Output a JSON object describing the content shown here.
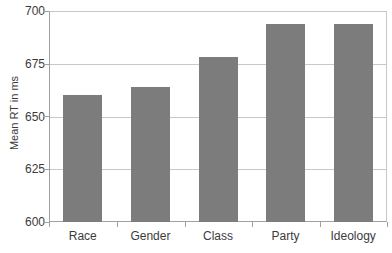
{
  "chart_data": {
    "type": "bar",
    "title": "",
    "xlabel": "",
    "ylabel": "Mean RT in ms",
    "categories": [
      "Race",
      "Gender",
      "Class",
      "Party",
      "Ideology"
    ],
    "values": [
      660,
      664,
      678,
      694,
      694
    ],
    "ylim": [
      600,
      700
    ],
    "yticks": [
      600,
      625,
      650,
      675,
      700
    ],
    "ytick_labels": [
      "600",
      "625",
      "650",
      "675",
      "700"
    ],
    "grid": true,
    "legend": false,
    "bar_color": "#7c7c7c",
    "background_color": "#ffffff",
    "gridline_color": "#c8c8c8",
    "axis_color": "#a0a0a0",
    "series": [
      {
        "name": "Mean RT",
        "values": [
          660,
          664,
          678,
          694,
          694
        ]
      }
    ]
  }
}
